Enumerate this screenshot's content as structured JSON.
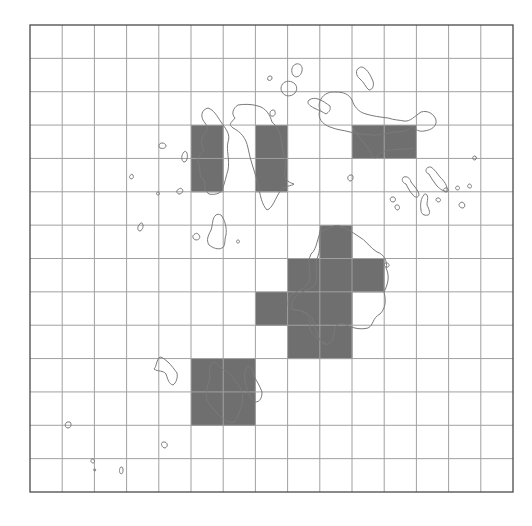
{
  "map": {
    "type": "grid-overlay-map",
    "grid": {
      "left": 30,
      "top": 25,
      "right": 513,
      "bottom": 492,
      "columns": 15,
      "rows": 14,
      "line_color": "#a0a0a0",
      "frame_color": "#4a4a4a"
    },
    "shaded_cell_color": "#6f6f6f",
    "outline_color": "#7a7a7a",
    "outline_inside_color": "#1e1e1e",
    "shaded_cells": [
      {
        "col": 5,
        "row": 3
      },
      {
        "col": 5,
        "row": 4
      },
      {
        "col": 7,
        "row": 3
      },
      {
        "col": 7,
        "row": 4
      },
      {
        "col": 10,
        "row": 3
      },
      {
        "col": 11,
        "row": 3
      },
      {
        "col": 9,
        "row": 6
      },
      {
        "col": 8,
        "row": 7
      },
      {
        "col": 9,
        "row": 7
      },
      {
        "col": 10,
        "row": 7
      },
      {
        "col": 7,
        "row": 8
      },
      {
        "col": 8,
        "row": 8
      },
      {
        "col": 9,
        "row": 8
      },
      {
        "col": 8,
        "row": 9
      },
      {
        "col": 9,
        "row": 9
      },
      {
        "col": 5,
        "row": 10
      },
      {
        "col": 6,
        "row": 10
      },
      {
        "col": 5,
        "row": 11
      },
      {
        "col": 6,
        "row": 11
      }
    ],
    "islands": [
      {
        "name": "island-west-strip",
        "d": "M208,108 C201,110 201,116 203,120 C205,124 210,127 206,132 C201,136 200,145 204,150 C200,155 196,158 199,165 C201,170 198,177 204,180 C206,185 203,190 209,194 C214,195 220,194 222,190 C225,183 226,176 228,170 C230,160 226,150 228,142 C231,134 225,128 221,122 C217,116 214,110 208,108 Z"
      },
      {
        "name": "island-center-long",
        "d": "M238,105 C233,108 231,114 235,118 C231,123 228,124 233,128 C241,132 246,138 248,148 C250,160 255,172 258,184 C260,195 262,205 267,210 C273,208 275,198 281,190 C284,186 292,186 294,184 C287,182 283,178 285,170 C288,160 282,152 282,144 C281,134 277,126 272,122 C270,115 266,108 258,106 C252,104 244,104 238,105 Z"
      },
      {
        "name": "island-north-ne",
        "d": "M328,93 C322,95 317,103 320,110 C317,118 322,124 330,127 C337,130 343,130 350,132 C357,134 364,134 372,135 C381,136 389,132 396,132 C402,132 410,130 412,126 C415,130 420,132 424,131 C432,130 437,126 436,120 C434,114 428,110 421,112 C415,116 410,122 404,121 C399,120 394,120 388,118 C380,117 372,116 366,114 C358,112 354,106 352,100 C349,94 343,92 336,92 C332,92 330,92 328,93 Z"
      },
      {
        "name": "island-north-ne-inner-edge",
        "d": "M352,126 C356,134 362,140 368,148 C372,154 372,158 376,158 C380,152 384,150 392,150 C400,148 408,150 414,148"
      },
      {
        "name": "island-north-small-1",
        "d": "M296,64 C291,66 291,72 293,75 C296,79 301,76 302,71 C303,66 300,63 296,64 Z"
      },
      {
        "name": "island-north-small-2",
        "d": "M285,82 C281,84 280,89 282,92 C285,97 291,97 295,93 C298,89 297,84 292,82 C290,81 287,81 285,82 Z"
      },
      {
        "name": "island-north-small-3",
        "d": "M270,76 C268,76 267,78 268,80 C270,81 272,80 272,78 C272,76 271,76 270,76 Z"
      },
      {
        "name": "island-north-small-4",
        "d": "M273,110 C270,110 269,114 271,116 C274,117 276,114 275,112 C275,110 274,110 273,110 Z"
      },
      {
        "name": "island-north-elongated",
        "d": "M359,68 C355,70 356,76 360,79 C364,82 366,88 369,90 C373,90 375,84 372,79 C370,74 366,68 362,67 C361,67 360,67 359,68 Z"
      },
      {
        "name": "island-north-bumpy",
        "d": "M309,100 C306,103 310,106 314,108 C318,110 323,112 326,114 C329,112 331,110 330,106 C327,104 322,100 318,99 C315,98 312,98 309,100 Z"
      },
      {
        "name": "island-center-stem",
        "d": "M216,215 C212,218 213,224 211,230 C208,236 206,240 209,245 C213,248 218,250 222,248 C226,246 224,240 226,235 C227,228 225,220 221,215 C219,214 217,214 216,215 Z"
      },
      {
        "name": "island-west-small-1",
        "d": "M162,143 C159,143 158,146 160,148 C163,149 166,148 166,146 C166,144 164,143 162,143 Z"
      },
      {
        "name": "island-west-small-2",
        "d": "M184,152 C181,155 181,161 184,162 C187,162 188,157 187,153 C186,151 185,151 184,152 Z"
      },
      {
        "name": "island-west-small-3",
        "d": "M131,175 C129,176 129,178 131,179 C133,179 134,177 133,175 C132,174 131,174 131,175 Z"
      },
      {
        "name": "island-west-small-4",
        "d": "M158,192 C156,192 156,195 158,195 C160,195 160,192 158,192 Z"
      },
      {
        "name": "island-west-small-5",
        "d": "M179,189 C176,190 176,193 179,194 C182,194 184,191 182,189 C181,188 180,188 179,189 Z"
      },
      {
        "name": "island-west-small-6",
        "d": "M140,224 C137,226 137,231 140,231 C143,230 144,225 142,223 C141,223 140,223 140,224 Z"
      },
      {
        "name": "island-west-small-7",
        "d": "M195,234 C192,235 192,239 196,240 C200,240 201,236 198,234 C197,233 196,233 195,234 Z"
      },
      {
        "name": "island-west-small-8",
        "d": "M238,240 C236,240 236,243 238,243 C240,243 240,240 238,240 Z"
      },
      {
        "name": "island-east-1",
        "d": "M404,177 C401,178 402,183 406,184 C408,188 410,192 413,195 C415,198 419,198 419,194 C418,190 414,186 411,182 C410,178 407,176 404,177 Z"
      },
      {
        "name": "island-east-2",
        "d": "M429,167 C425,168 425,173 429,174 C431,178 434,182 437,186 C440,189 444,192 447,191 C448,186 444,181 440,177 C437,173 434,169 431,167 C430,167 429,167 429,167 Z"
      },
      {
        "name": "island-east-3",
        "d": "M424,195 C421,198 420,204 421,210 C421,214 424,216 428,215 C431,214 429,209 427,205 C427,201 429,196 426,194 C425,194 424,194 424,195 Z"
      },
      {
        "name": "island-east-small-a",
        "d": "M392,197 C389,198 390,202 393,202 C396,202 396,198 394,197 Z"
      },
      {
        "name": "island-east-small-b",
        "d": "M396,205 C394,206 395,210 398,210 C400,209 400,206 398,205 Z"
      },
      {
        "name": "island-east-small-c",
        "d": "M437,198 C435,199 436,202 439,202 C441,201 441,199 439,198 Z"
      },
      {
        "name": "island-east-small-d",
        "d": "M445,188 C443,189 443,192 446,192 C449,192 449,189 447,188 Z"
      },
      {
        "name": "island-east-small-e",
        "d": "M457,186 C455,187 455,190 458,190 C460,189 460,187 458,186 Z"
      },
      {
        "name": "island-east-small-f",
        "d": "M460,203 C458,204 459,208 463,208 C466,207 465,203 462,202 Z"
      },
      {
        "name": "island-east-small-g",
        "d": "M469,184 C467,185 467,188 470,188 C472,188 472,185 470,184 Z"
      },
      {
        "name": "island-east-small-h",
        "d": "M474,156 C472,157 472,160 475,160 C477,159 477,157 475,156 Z"
      },
      {
        "name": "island-east-small-i",
        "d": "M350,175 C347,176 347,180 350,181 C353,181 354,177 352,175 Z"
      },
      {
        "name": "island-central-large",
        "d": "M340,226 C334,224 330,228 322,231 C316,238 318,248 311,254 C306,264 312,272 309,282 C304,290 297,290 290,296 C286,304 288,312 298,310 C303,312 310,312 313,320 C316,330 318,340 324,344 C330,346 333,340 334,334 C334,326 338,322 344,324 C352,328 360,330 368,328 C374,325 372,318 380,314 C386,308 386,300 384,292 C388,284 390,276 386,268 C388,262 384,254 377,252 C370,248 366,240 358,236 C352,232 346,228 340,226 Z"
      },
      {
        "name": "island-central-inner-edge",
        "d": "M322,226 C316,236 322,246 318,256 C314,264 318,274 316,282 C314,290 302,290 296,296 C290,302 290,312 300,310 C306,314 312,318 310,326 C308,334 320,340 326,344"
      },
      {
        "name": "island-central-east-nub",
        "d": "M385,263 C383,265 385,268 388,267 C390,266 389,263 387,263 Z"
      },
      {
        "name": "island-southwest-small",
        "d": "M160,357 C156,360 157,366 154,369 C158,372 163,370 166,374 C168,380 169,384 173,385 C176,383 178,378 177,373 C174,369 172,366 168,362 C165,360 163,357 160,357 Z"
      },
      {
        "name": "island-southwest-main",
        "d": "M213,362 C209,366 209,372 210,378 C208,385 205,392 207,400 C210,406 214,410 218,414 C222,418 228,424 234,422 C238,418 240,410 242,404 C244,396 242,388 236,382 C232,376 228,372 224,370 C220,368 217,362 213,362 Z"
      },
      {
        "name": "island-southwest-east",
        "d": "M248,366 C244,370 244,378 246,386 C248,392 250,398 255,402 C260,402 262,398 262,392 C260,386 257,382 254,376 C253,370 251,366 248,366 Z"
      },
      {
        "name": "island-south-small-1",
        "d": "M67,422 C64,424 65,428 68,428 C71,428 72,424 70,422 Z"
      },
      {
        "name": "island-south-small-2",
        "d": "M163,442 C160,443 162,448 165,448 C168,447 168,443 165,442 Z"
      },
      {
        "name": "island-south-small-3",
        "d": "M92,459 C90,460 91,463 93,463 C95,463 95,460 93,459 Z"
      },
      {
        "name": "island-south-small-4",
        "d": "M94,469 C93,470 94,471 95,471 C96,471 96,469 95,469 Z"
      },
      {
        "name": "island-south-small-5",
        "d": "M121,467 C119,468 119,473 121,474 C123,474 124,469 122,467 Z"
      }
    ]
  }
}
